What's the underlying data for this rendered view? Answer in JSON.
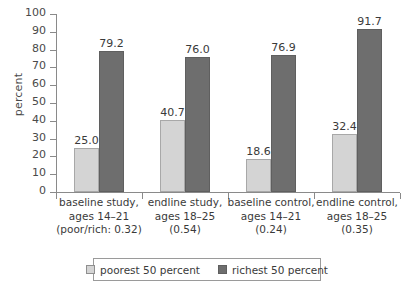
{
  "chart_data": {
    "type": "bar",
    "title": "",
    "subtitle": "",
    "xlabel": "",
    "ylabel": "percent",
    "ylim": [
      0,
      100
    ],
    "ytick_step": 10,
    "yticks": [
      0,
      10,
      20,
      30,
      40,
      50,
      60,
      70,
      80,
      90,
      100
    ],
    "ytick_labels": [
      "0",
      "10",
      "20",
      "30",
      "40",
      "50",
      "60",
      "70",
      "80",
      "90",
      "100"
    ],
    "grid": false,
    "legend_position": "bottom",
    "categories": [
      "baseline study, ages 14-21 (poor/rich: 0.32)",
      "endline study, ages 18-25 (0.54)",
      "baseline control, ages 14-21 (0.24)",
      "endline control, ages 18-25 (0.35)"
    ],
    "category_lines": [
      [
        "baseline study,",
        "ages 14–21",
        "(poor/rich: 0.32)"
      ],
      [
        "endline study,",
        "ages 18–25",
        "(0.54)"
      ],
      [
        "baseline control,",
        "ages 14–21",
        "(0.24)"
      ],
      [
        "endline control,",
        "ages 18–25",
        "(0.35)"
      ]
    ],
    "series": [
      {
        "name": "poorest 50 percent",
        "color": "#d4d4d4",
        "values": [
          25.0,
          40.7,
          18.6,
          32.4
        ],
        "labels": [
          "25.0",
          "40.7",
          "18.6",
          "32.4"
        ]
      },
      {
        "name": "richest 50 percent",
        "color": "#6e6e6e",
        "values": [
          79.2,
          76.0,
          76.9,
          91.7
        ],
        "labels": [
          "79.2",
          "76.0",
          "76.9",
          "91.7"
        ]
      }
    ]
  },
  "legend": {
    "items": [
      {
        "label": "poorest 50 percent"
      },
      {
        "label": "richest 50 percent"
      }
    ]
  }
}
